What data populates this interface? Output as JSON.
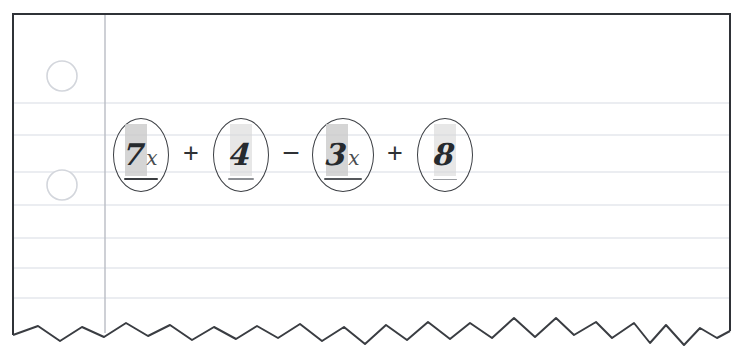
{
  "page": {
    "paper_color": "#ffffff",
    "border_color": "#2f3237",
    "rule_line_color": "#e3e6ec",
    "margin_line_color": "#b9bcc4",
    "hole_color": "#d6d8dd",
    "torn_edge_color": "#3a3d42"
  },
  "expression": {
    "full_text": "7x + 4 - 3x + 8",
    "terms": [
      {
        "id": "term-7x",
        "coefficient": "7",
        "variable": "x",
        "highlighted": true,
        "circled": true,
        "underlined": true,
        "underline_style": "dark"
      },
      {
        "id": "term-4",
        "coefficient": "4",
        "variable": "",
        "highlighted": true,
        "circled": true,
        "underlined": true,
        "underline_style": "thin"
      },
      {
        "id": "term-3x",
        "coefficient": "3",
        "variable": "x",
        "highlighted": true,
        "circled": true,
        "underlined": true,
        "underline_style": "medium"
      },
      {
        "id": "term-8",
        "coefficient": "8",
        "variable": "",
        "highlighted": true,
        "circled": true,
        "underlined": true,
        "underline_style": "faint"
      }
    ],
    "operators": [
      "+",
      "−",
      "+"
    ]
  },
  "paper": {
    "hole_punches": [
      {
        "cx": 62,
        "cy": 76,
        "r": 15
      },
      {
        "cx": 62,
        "cy": 185,
        "r": 15
      }
    ],
    "margin_line_x": 105,
    "rule_lines_y": [
      103,
      135,
      172,
      205,
      238,
      268,
      298
    ],
    "bounds": {
      "left": 13,
      "top": 14,
      "right": 730,
      "bottom": 330
    }
  }
}
